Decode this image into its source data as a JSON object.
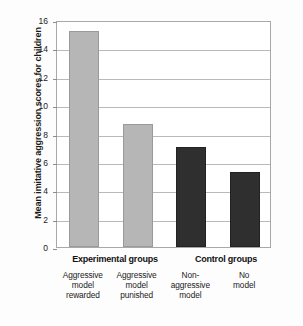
{
  "chart_data": {
    "type": "bar",
    "title": "",
    "subtitle": "",
    "xlabel": "",
    "ylabel": "Mean imitative aggression scores for children",
    "ylim": [
      0,
      16
    ],
    "ytick_values": [
      0,
      2,
      4,
      6,
      8,
      10,
      12,
      14,
      16
    ],
    "ytick_labels": [
      "0",
      "2",
      "4",
      "6",
      "8",
      "10",
      "12",
      "14",
      "16"
    ],
    "grid": true,
    "legend": "none",
    "categories": [
      "Aggressive model rewarded",
      "Aggressive model punished",
      "Non-aggressive model",
      "No model"
    ],
    "values": [
      15.2,
      8.7,
      7.05,
      5.3
    ],
    "bar_colors": [
      "#b6b6b6",
      "#b6b6b6",
      "#2f2f2f",
      "#2f2f2f"
    ],
    "groups": [
      {
        "label": "Experimental groups",
        "categories": [
          0,
          1
        ]
      },
      {
        "label": "Control groups",
        "categories": [
          2,
          3
        ]
      }
    ]
  },
  "axis": {
    "y_title": "Mean imitative aggression scores for children",
    "ticks": [
      {
        "value": 16,
        "label": "16"
      },
      {
        "value": 14,
        "label": "14"
      },
      {
        "value": 12,
        "label": "12"
      },
      {
        "value": 10,
        "label": "10"
      },
      {
        "value": 8,
        "label": "8"
      },
      {
        "value": 6,
        "label": "6"
      },
      {
        "value": 4,
        "label": "4"
      },
      {
        "value": 2,
        "label": "2"
      },
      {
        "value": 0,
        "label": "0"
      }
    ]
  },
  "bars": [
    {
      "name": "aggressive-model-rewarded",
      "value": 15.2,
      "style": "light"
    },
    {
      "name": "aggressive-model-punished",
      "value": 8.7,
      "style": "light"
    },
    {
      "name": "non-aggressive-model",
      "value": 7.05,
      "style": "dark"
    },
    {
      "name": "no-model",
      "value": 5.3,
      "style": "dark"
    }
  ],
  "groups": {
    "experimental": "Experimental groups",
    "control": "Control groups"
  },
  "categories": [
    {
      "line1": "Aggressive",
      "line2": "model",
      "line3": "rewarded"
    },
    {
      "line1": "Aggressive",
      "line2": "model",
      "line3": "punished"
    },
    {
      "line1": "Non-",
      "line2": "aggressive",
      "line3": "model"
    },
    {
      "line1": "No",
      "line2": "model",
      "line3": ""
    }
  ],
  "colors": {
    "light_bar": "#b6b6b6",
    "dark_bar": "#2f2f2f",
    "gridline": "#b9b9b9",
    "frame": "#a8a8a8",
    "text": "#1b1b1b",
    "background": "#ffffff"
  }
}
